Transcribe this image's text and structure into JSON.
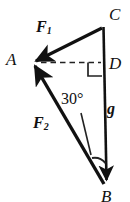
{
  "figure": {
    "kind": "force-triangle-diagram",
    "width": 130,
    "height": 202,
    "background_color": "#ffffff",
    "stroke_color": "#111111"
  },
  "points": {
    "A": {
      "label": "A",
      "x": 31,
      "y": 63
    },
    "B": {
      "label": "B",
      "x": 107,
      "y": 187
    },
    "C": {
      "label": "C",
      "x": 104,
      "y": 27
    },
    "D": {
      "label": "D",
      "x": 104,
      "y": 63
    }
  },
  "vectors": {
    "F1": {
      "label": "F",
      "subscript": "1",
      "from": "C",
      "to": "A",
      "arrow_at": "A"
    },
    "F2": {
      "label": "F",
      "subscript": "2",
      "from": "B",
      "to": "A",
      "arrow_at": "A"
    },
    "g": {
      "label": "g",
      "from": "C",
      "to": "B",
      "arrow_at": "B"
    }
  },
  "annotations": {
    "angle": {
      "value": "30",
      "unit": "°",
      "text": "30°",
      "at_vertex": "B"
    },
    "right_angle": {
      "at_vertex": "D",
      "marker": "square"
    },
    "dashed_line": {
      "from": "A",
      "to": "D",
      "style": "dashed"
    },
    "leader_line": {
      "from_label": "30°",
      "to": "angle-arc"
    }
  },
  "icons": {
    "arrowhead": "arrowhead-icon",
    "right_angle_square": "right-angle-marker-icon",
    "angle_arc": "angle-arc-icon"
  }
}
